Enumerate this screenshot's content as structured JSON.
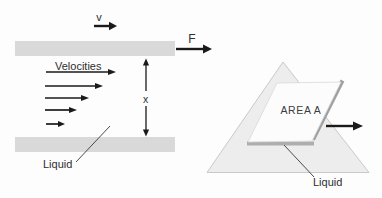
{
  "figure": {
    "colors": {
      "background": "#fdfdfd",
      "plate_gray": "#d9d9d9",
      "surface_fill": "#ededed",
      "surface_edge": "#c9c9c9",
      "plate_face": "#fcfcfc",
      "plate_face_edge": "#d8d8d8",
      "shadow_bottom": "#aeaeae",
      "shadow_right": "#9f9f9f",
      "ink": "#1a1a1a"
    },
    "left_diagram": {
      "top_plate_velocity_label": "v",
      "force_label": "F",
      "velocity_profile_label": "Velocities",
      "gap_dimension_label": "x",
      "liquid_label": "Liquid"
    },
    "right_diagram": {
      "plate_area_label": "AREA A",
      "liquid_label": "Liquid"
    }
  }
}
